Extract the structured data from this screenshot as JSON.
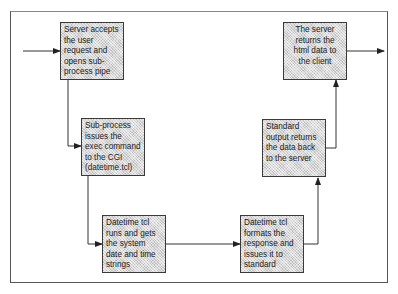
{
  "diagram": {
    "type": "flowchart",
    "steps": [
      {
        "id": "s1",
        "text": "Server accepts the user request and opens sub-process pipe"
      },
      {
        "id": "s2",
        "text": "Sub-process issues the exec command to the CGI (datetime.tcl)"
      },
      {
        "id": "s3",
        "text": "Datetime tcl runs and gets the system date and time strings"
      },
      {
        "id": "s4",
        "text": "Datetime tcl formats the response and issues it to standard output"
      },
      {
        "id": "s5",
        "text": "Standard output returns the data back to the server"
      },
      {
        "id": "s6",
        "text": "The server returns the html data to the client"
      }
    ],
    "edges": [
      {
        "from": "input",
        "to": "s1"
      },
      {
        "from": "s1",
        "to": "s2"
      },
      {
        "from": "s2",
        "to": "s3"
      },
      {
        "from": "s3",
        "to": "s4"
      },
      {
        "from": "s4",
        "to": "s5"
      },
      {
        "from": "s5",
        "to": "s6"
      },
      {
        "from": "s6",
        "to": "output"
      }
    ],
    "colors": {
      "box_fill": "#d9d9d9",
      "line": "#333333",
      "frame": "#555555"
    }
  }
}
